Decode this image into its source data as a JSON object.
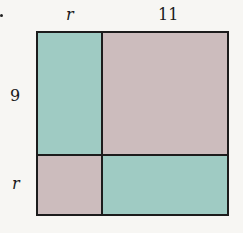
{
  "diagram": {
    "labels": {
      "top_left": "r",
      "top_right": "11",
      "left_top": "9",
      "left_bottom": "r"
    },
    "regions": [
      {
        "name": "top-left",
        "width_label": "r",
        "height_label": "9",
        "color": "#9fcbc3"
      },
      {
        "name": "top-right",
        "width_label": "11",
        "height_label": "9",
        "color": "#ccbcbd"
      },
      {
        "name": "bottom-left",
        "width_label": "r",
        "height_label": "r",
        "color": "#ccbcbd"
      },
      {
        "name": "bottom-right",
        "width_label": "11",
        "height_label": "r",
        "color": "#9fcbc3"
      }
    ]
  }
}
